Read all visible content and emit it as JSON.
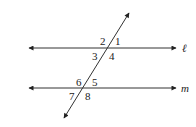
{
  "diagram": {
    "lines": [
      {
        "id": "l",
        "label": "ℓ"
      },
      {
        "id": "m",
        "label": "m"
      }
    ],
    "transversal": {
      "id": "t",
      "label": ""
    },
    "angles": [
      {
        "id": "1",
        "label": "1"
      },
      {
        "id": "2",
        "label": "2"
      },
      {
        "id": "3",
        "label": "3"
      },
      {
        "id": "4",
        "label": "4"
      },
      {
        "id": "5",
        "label": "5"
      },
      {
        "id": "6",
        "label": "6"
      },
      {
        "id": "7",
        "label": "7"
      },
      {
        "id": "8",
        "label": "8"
      }
    ],
    "colors": {
      "ink": "#222222",
      "background": "#ffffff"
    }
  }
}
